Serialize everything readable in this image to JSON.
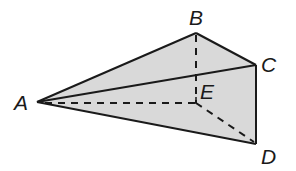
{
  "diagram": {
    "type": "pyramid",
    "fill_color": "#d9d9d9",
    "line_color": "#1a1a1a",
    "vertices": [
      {
        "label": "A",
        "x": 37,
        "y": 102
      },
      {
        "label": "B",
        "x": 196,
        "y": 33
      },
      {
        "label": "C",
        "x": 256,
        "y": 65
      },
      {
        "label": "D",
        "x": 256,
        "y": 144
      },
      {
        "label": "E",
        "x": 196,
        "y": 103
      }
    ],
    "solid_edges": [
      "AB",
      "BC",
      "AC",
      "CD",
      "AD"
    ],
    "dashed_edges": [
      "BE",
      "AE",
      "ED"
    ],
    "right_angle_at": "E"
  }
}
